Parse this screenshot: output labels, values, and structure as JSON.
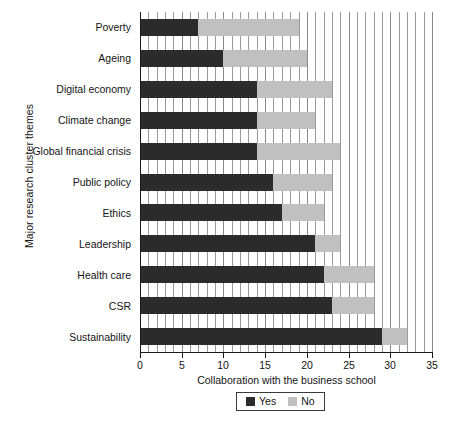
{
  "chart_data": {
    "type": "bar",
    "orientation": "horizontal",
    "stacked": true,
    "title": "",
    "xlabel": "Collaboration with the business school",
    "ylabel": "Major research cluster themes",
    "xlim": [
      0,
      35
    ],
    "xticks": [
      0,
      5,
      10,
      15,
      20,
      25,
      30,
      35
    ],
    "xtick_labels": [
      "0",
      "5",
      "10",
      "15",
      "20",
      "25",
      "30",
      "35"
    ],
    "grid": true,
    "grid_axis": "x",
    "grid_interval": 1,
    "legend_position": "bottom",
    "categories": [
      "Poverty",
      "Ageing",
      "Digital economy",
      "Climate change",
      "Global financial crisis",
      "Public policy",
      "Ethics",
      "Leadership",
      "Health care",
      "CSR",
      "Sustainability"
    ],
    "series": [
      {
        "name": "Yes",
        "color": "#2b2b2b",
        "values": [
          7,
          10,
          14,
          14,
          14,
          16,
          17,
          21,
          22,
          23,
          29
        ]
      },
      {
        "name": "No",
        "color": "#c0c0c0",
        "values": [
          12,
          10,
          9,
          7,
          10,
          7,
          5,
          3,
          6,
          5,
          3
        ]
      }
    ],
    "totals": [
      19,
      20,
      23,
      21,
      24,
      23,
      22,
      24,
      28,
      28,
      32
    ]
  },
  "legend": {
    "items": [
      {
        "label": "Yes",
        "color": "#2b2b2b"
      },
      {
        "label": "No",
        "color": "#c0c0c0"
      }
    ]
  }
}
